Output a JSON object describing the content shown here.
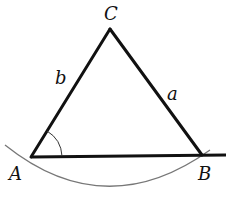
{
  "diagram": {
    "vertices": {
      "A": "A",
      "B": "B",
      "C": "C"
    },
    "sides": {
      "a": "a",
      "b": "b"
    },
    "colors": {
      "triangle": "#111111",
      "arc": "#777777",
      "background": "#ffffff"
    }
  }
}
